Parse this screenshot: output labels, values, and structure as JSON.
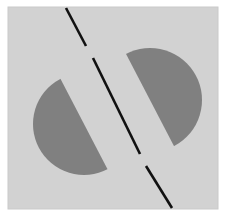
{
  "figure": {
    "width": 227,
    "height": 223,
    "colors": {
      "page_background": "#ffffff",
      "panel_background": "#d2d2d2",
      "panel_background_edge": "#cacaca",
      "shape_fill": "#808080",
      "cut_line": "#111111"
    },
    "panel": {
      "x": 8,
      "y": 7,
      "width": 210,
      "height": 202
    },
    "cut_line": {
      "stroke_width": 2.6,
      "angle_deg_from_vertical": 27.5,
      "segments": [
        {
          "x1": 66,
          "y1": 8,
          "x2": 86,
          "y2": 46
        },
        {
          "x1": 93,
          "y1": 58,
          "x2": 140,
          "y2": 154
        },
        {
          "x1": 146,
          "y1": 166,
          "x2": 172,
          "y2": 208
        }
      ]
    },
    "shapes": [
      {
        "name": "left-half-disc",
        "side": "left",
        "center_x": 84,
        "center_y": 124,
        "radius": 51,
        "flat_edge_angle_deg": 27.5,
        "fill": "#808080"
      },
      {
        "name": "right-half-disc",
        "side": "right",
        "center_x": 150,
        "center_y": 100,
        "radius": 52,
        "flat_edge_angle_deg": 27.5,
        "fill": "#808080"
      }
    ]
  }
}
